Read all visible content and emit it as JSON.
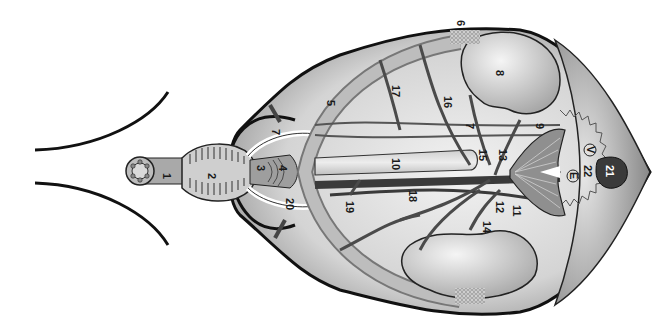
{
  "diagram": {
    "type": "anatomical-illustration",
    "orientation": "rotated 90deg, labels read top-to-bottom",
    "colors": {
      "outline": "#1a1a1a",
      "vessel": "#5a5a5a",
      "tissue_light": "#e6e6e6",
      "tissue_mid": "#bdbdbd",
      "tissue_dark": "#8a8a8a",
      "badge_21": "#3a3a3a"
    },
    "labels": [
      {
        "id": "1",
        "text": "1",
        "x": 167,
        "y": 180
      },
      {
        "id": "2",
        "text": "2",
        "x": 212,
        "y": 180
      },
      {
        "id": "3",
        "text": "3",
        "x": 261,
        "y": 170
      },
      {
        "id": "4",
        "text": "4",
        "x": 283,
        "y": 170
      },
      {
        "id": "5",
        "text": "5",
        "x": 330,
        "y": 105
      },
      {
        "id": "6",
        "text": "6",
        "x": 461,
        "y": 25
      },
      {
        "id": "7a",
        "text": "7",
        "x": 275,
        "y": 134
      },
      {
        "id": "7b",
        "text": "7",
        "x": 470,
        "y": 128
      },
      {
        "id": "8",
        "text": "8",
        "x": 500,
        "y": 75
      },
      {
        "id": "9",
        "text": "9",
        "x": 540,
        "y": 128
      },
      {
        "id": "10",
        "text": "10",
        "x": 396,
        "y": 166
      },
      {
        "id": "11",
        "text": "11",
        "x": 517,
        "y": 212
      },
      {
        "id": "12",
        "text": "12",
        "x": 500,
        "y": 208
      },
      {
        "id": "13",
        "text": "13",
        "x": 503,
        "y": 156
      },
      {
        "id": "14",
        "text": "14",
        "x": 487,
        "y": 228
      },
      {
        "id": "15",
        "text": "15",
        "x": 483,
        "y": 156
      },
      {
        "id": "16",
        "text": "16",
        "x": 448,
        "y": 103
      },
      {
        "id": "17",
        "text": "17",
        "x": 396,
        "y": 92
      },
      {
        "id": "18",
        "text": "18",
        "x": 413,
        "y": 197
      },
      {
        "id": "19",
        "text": "19",
        "x": 350,
        "y": 208
      },
      {
        "id": "20",
        "text": "20",
        "x": 290,
        "y": 205
      },
      {
        "id": "21",
        "text": "21",
        "x": 610,
        "y": 172
      },
      {
        "id": "22",
        "text": "22",
        "x": 588,
        "y": 172
      },
      {
        "id": "V",
        "text": "V",
        "x": 590,
        "y": 154
      },
      {
        "id": "E",
        "text": "E",
        "x": 573,
        "y": 180
      }
    ]
  }
}
